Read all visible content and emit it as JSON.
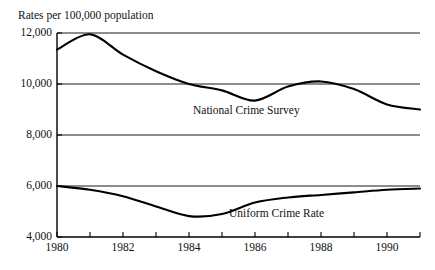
{
  "chart_data": {
    "type": "line",
    "title": "",
    "xlabel": "",
    "ylabel": "Rates per 100,000 population",
    "ylim": [
      4000,
      12000
    ],
    "xlim": [
      1980,
      1991
    ],
    "grid": true,
    "legend_position": "inline-labels",
    "y_ticks": [
      4000,
      6000,
      8000,
      10000,
      12000
    ],
    "y_tick_labels": [
      "4,000",
      "6,000",
      "8,000",
      "10,000",
      "12,000"
    ],
    "x_ticks": [
      1980,
      1981,
      1982,
      1983,
      1984,
      1985,
      1986,
      1987,
      1988,
      1989,
      1990,
      1991
    ],
    "x_tick_labels": [
      "1980",
      "",
      "1982",
      "",
      "1984",
      "",
      "1986",
      "",
      "1988",
      "",
      "1990",
      ""
    ],
    "x_labeled_ticks": [
      {
        "year": 1980,
        "label": "1980"
      },
      {
        "year": 1982,
        "label": "1982"
      },
      {
        "year": 1984,
        "label": "1984"
      },
      {
        "year": 1986,
        "label": "1986"
      },
      {
        "year": 1988,
        "label": "1988"
      },
      {
        "year": 1990,
        "label": "1990"
      }
    ],
    "x": [
      1980,
      1981,
      1982,
      1983,
      1984,
      1985,
      1986,
      1987,
      1988,
      1989,
      1990,
      1991
    ],
    "series": [
      {
        "name": "National Crime Survey",
        "color": "#000000",
        "values": [
          11350,
          11950,
          11150,
          10500,
          10000,
          9750,
          9350,
          9900,
          10100,
          9800,
          9200,
          9000
        ]
      },
      {
        "name": "Uniform Crime Rate",
        "color": "#000000",
        "values": [
          6000,
          5850,
          5600,
          5200,
          4820,
          4900,
          5350,
          5550,
          5650,
          5750,
          5850,
          5900
        ]
      }
    ],
    "annotations": [
      {
        "text": "National Crime Survey",
        "series": "National Crime Survey"
      },
      {
        "text": "Uniform Crime Rate",
        "series": "Uniform Crime Rate"
      }
    ]
  }
}
